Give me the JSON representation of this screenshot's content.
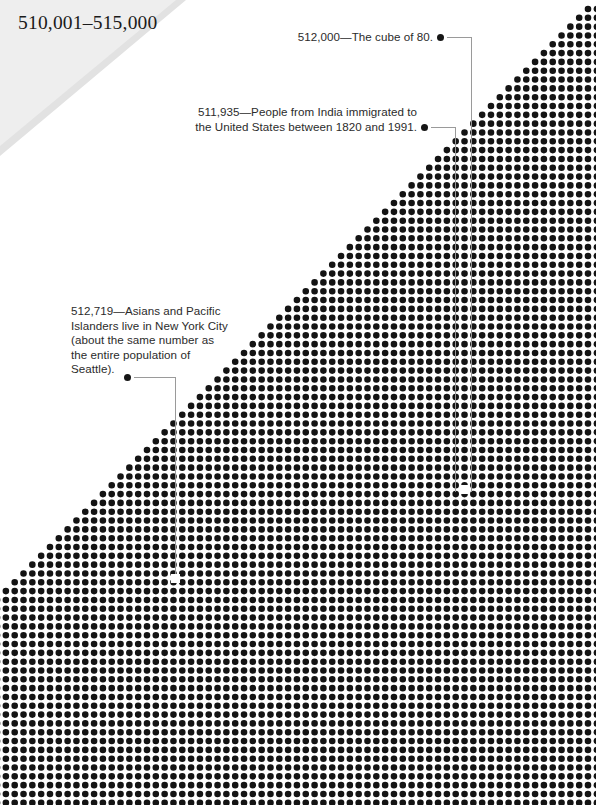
{
  "page": {
    "banner_label": "510,001–515,000",
    "background_color": "#ffffff",
    "banner_color": "#e8e8e8",
    "dot_color": "#141414",
    "leader_color": "#8d8d8d"
  },
  "dot_field": {
    "description": "right-triangle field of dots, apex at top-right, expanding down and to the left, filling the bottom of the page",
    "pitch": 8.82,
    "dot_diameter": 6.6,
    "apex_x": 588,
    "apex_y": 9,
    "left_edge_y": 600
  },
  "annotations": [
    {
      "id": "cube-of-80",
      "value": "512,000",
      "lines": [
        "512,000—The cube of 80."
      ],
      "bullet": {
        "x": 437,
        "y": 34
      },
      "marker": {
        "x": 464,
        "y": 489
      }
    },
    {
      "id": "india-immigration",
      "value": "511,935",
      "lines": [
        "511,935—People from India immigrated to",
        "the United States between 1820 and 1991."
      ],
      "bullet": {
        "x": 421,
        "y": 124
      },
      "marker": null
    },
    {
      "id": "asians-pacific-islanders-nyc",
      "value": "512,719",
      "lines": [
        "512,719—Asians and Pacific",
        "Islanders live in New York City",
        "(about the same number as",
        "the entire population of",
        "Seattle)."
      ],
      "bullet": {
        "x": 124,
        "y": 374
      },
      "marker": {
        "x": 171,
        "y": 574
      }
    }
  ]
}
